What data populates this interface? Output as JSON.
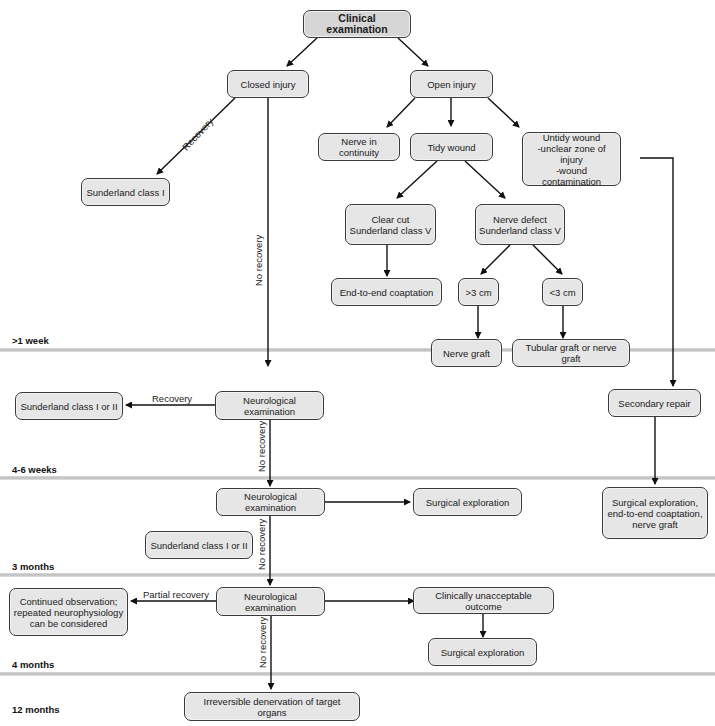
{
  "diagram": {
    "time_bands": [
      {
        "label": ">1 week"
      },
      {
        "label": "4-6 weeks"
      },
      {
        "label": "3 months"
      },
      {
        "label": "4 months"
      },
      {
        "label": "12 months"
      }
    ],
    "nodes": {
      "clinical_examination": "Clinical examination",
      "closed_injury": "Closed injury",
      "open_injury": "Open injury",
      "sunderland_class_i": "Sunderland class I",
      "nerve_in_continuity": "Nerve in continuity",
      "tidy_wound": "Tidy wound",
      "untidy_wound": "Untidy wound\n-unclear zone of injury\n-wound contamination",
      "clear_cut": "Clear cut\nSunderland class V",
      "nerve_defect": "Nerve defect\nSunderland class V",
      "end_to_end": "End-to-end coaptation",
      "gt3cm": ">3 cm",
      "lt3cm": "<3 cm",
      "nerve_graft": "Nerve graft",
      "tubular_graft": "Tubular graft or nerve graft",
      "sunderland_i_ii_1": "Sunderland class I or II",
      "neuro_exam_1": "Neurological examination",
      "secondary_repair": "Secondary repair",
      "neuro_exam_2": "Neurological examination",
      "surgical_exploration_1": "Surgical exploration",
      "surgical_exploration_combined": "Surgical exploration,\nend-to-end coaptation,\nnerve graft",
      "sunderland_i_ii_2": "Sunderland class I or II",
      "continued_observation": "Continued observation;\nrepeated neurophysiology\ncan be considered",
      "neuro_exam_3": "Neurological examination",
      "clinically_unacceptable": "Clinically unacceptable outcome",
      "surgical_exploration_2": "Surgical exploration",
      "irreversible_denervation": "Irreversible denervation of target organs"
    },
    "edge_labels": {
      "recovery_1": "Recovery",
      "no_recovery_1": "No recovery",
      "recovery_2": "Recovery",
      "no_recovery_2": "No recovery",
      "no_recovery_3": "No recovery",
      "partial_recovery": "Partial recovery",
      "no_recovery_4": "No recovery"
    },
    "colors": {
      "node_fill": "#e6e6e6",
      "node_border": "#3a3a3a",
      "band": "#c4c4c4"
    }
  }
}
